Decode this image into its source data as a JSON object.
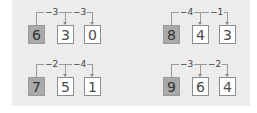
{
  "puzzles": [
    {
      "start": "6",
      "steps": [
        {
          "op": "−3",
          "result": "3"
        },
        {
          "op": "−3",
          "result": "0"
        }
      ]
    },
    {
      "start": "8",
      "steps": [
        {
          "op": "−4",
          "result": "4"
        },
        {
          "op": "−1",
          "result": "3"
        }
      ]
    },
    {
      "start": "7",
      "steps": [
        {
          "op": "−2",
          "result": "5"
        },
        {
          "op": "−4",
          "result": "1"
        }
      ]
    },
    {
      "start": "9",
      "steps": [
        {
          "op": "−3",
          "result": "6"
        },
        {
          "op": "−2",
          "result": "4"
        }
      ]
    }
  ],
  "colors": {
    "panel": "#ececec",
    "start_box": "#a9a9a9",
    "answer_box": "#ffffff",
    "line": "#9a9a9a"
  }
}
